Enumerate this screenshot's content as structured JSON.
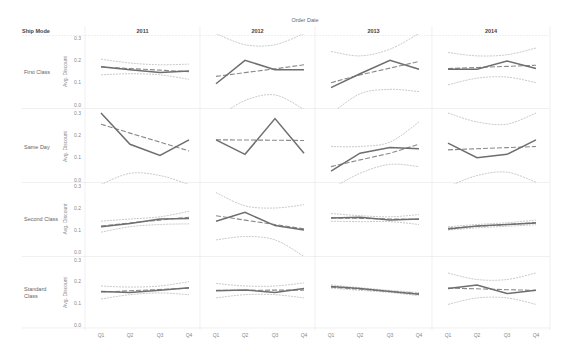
{
  "chart_data": {
    "type": "line",
    "title": "",
    "column_field": "Order Date",
    "row_field": "Ship Mode",
    "ylabel": "Avg. Discount",
    "ylim": [
      0,
      0.3
    ],
    "yticks": [
      "0.0",
      "0.1",
      "0.2",
      "0.3"
    ],
    "categories": [
      "Q1",
      "Q2",
      "Q3",
      "Q4"
    ],
    "columns": [
      "2011",
      "2012",
      "2013",
      "2014"
    ],
    "rows": [
      "First Class",
      "Same Day",
      "Second Class",
      "Standard Class"
    ],
    "grid": false,
    "panels": [
      {
        "row": "First Class",
        "year": "2011",
        "values": [
          0.171,
          0.158,
          0.145,
          0.152
        ],
        "trend": [
          0.17,
          0.163,
          0.156,
          0.149
        ],
        "band_upper": [
          0.205,
          0.188,
          0.18,
          0.183
        ],
        "band_lower": [
          0.135,
          0.14,
          0.135,
          0.115
        ]
      },
      {
        "row": "First Class",
        "year": "2012",
        "values": [
          0.095,
          0.2,
          0.158,
          0.158
        ],
        "trend": [
          0.128,
          0.145,
          0.162,
          0.18
        ],
        "band_upper": [
          0.32,
          0.27,
          0.27,
          0.32
        ],
        "band_lower": [
          -0.06,
          0.02,
          0.045,
          -0.02
        ]
      },
      {
        "row": "First Class",
        "year": "2013",
        "values": [
          0.078,
          0.14,
          0.2,
          0.16
        ],
        "trend": [
          0.1,
          0.135,
          0.165,
          0.195
        ],
        "band_upper": [
          0.24,
          0.22,
          0.25,
          0.32
        ],
        "band_lower": [
          -0.04,
          0.05,
          0.07,
          0.06
        ]
      },
      {
        "row": "First Class",
        "year": "2014",
        "values": [
          0.16,
          0.16,
          0.197,
          0.163
        ],
        "trend": [
          0.163,
          0.168,
          0.173,
          0.178
        ],
        "band_upper": [
          0.235,
          0.22,
          0.225,
          0.255
        ],
        "band_lower": [
          0.09,
          0.12,
          0.125,
          0.1
        ]
      }
    ],
    "panels_same_day": [
      {
        "row": "Same Day",
        "year": "2011",
        "values": [
          0.3,
          0.16,
          0.11,
          0.18
        ],
        "trend": [
          0.25,
          0.21,
          0.17,
          0.13
        ],
        "band_upper": [
          0.38,
          0.37,
          0.36,
          0.35
        ],
        "band_lower": [
          -0.02,
          0.03,
          0.02,
          -0.02
        ]
      },
      {
        "row": "Same Day",
        "year": "2012",
        "values": [
          0.18,
          0.115,
          0.275,
          0.12
        ],
        "trend": [
          0.18,
          0.179,
          0.178,
          0.177
        ],
        "band_upper": [
          0.42,
          0.4,
          0.4,
          0.42
        ],
        "band_lower": [
          -0.06,
          -0.05,
          -0.05,
          -0.06
        ]
      },
      {
        "row": "Same Day",
        "year": "2013",
        "values": [
          0.04,
          0.12,
          0.145,
          0.14
        ],
        "trend": [
          0.06,
          0.09,
          0.12,
          0.16
        ],
        "band_upper": [
          0.15,
          0.15,
          0.17,
          0.26
        ],
        "band_lower": [
          -0.04,
          0.03,
          0.07,
          0.06
        ]
      },
      {
        "row": "Same Day",
        "year": "2014",
        "values": [
          0.165,
          0.1,
          0.115,
          0.18
        ],
        "trend": [
          0.135,
          0.14,
          0.145,
          0.15
        ],
        "band_upper": [
          0.3,
          0.26,
          0.25,
          0.3
        ],
        "band_lower": [
          -0.03,
          0.02,
          0.035,
          -0.01
        ]
      }
    ],
    "panels_second_class": [
      {
        "row": "Second Class",
        "year": "2011",
        "values": [
          0.115,
          0.13,
          0.15,
          0.152
        ],
        "trend": [
          0.118,
          0.132,
          0.145,
          0.158
        ],
        "band_upper": [
          0.14,
          0.15,
          0.16,
          0.185
        ],
        "band_lower": [
          0.09,
          0.115,
          0.125,
          0.128
        ]
      },
      {
        "row": "Second Class",
        "year": "2012",
        "values": [
          0.14,
          0.18,
          0.12,
          0.1
        ],
        "trend": [
          0.165,
          0.145,
          0.125,
          0.105
        ],
        "band_upper": [
          0.27,
          0.21,
          0.2,
          0.215
        ],
        "band_lower": [
          0.055,
          0.07,
          0.055,
          -0.02
        ]
      },
      {
        "row": "Second Class",
        "year": "2013",
        "values": [
          0.155,
          0.158,
          0.145,
          0.15
        ],
        "trend": [
          0.155,
          0.153,
          0.15,
          0.148
        ],
        "band_upper": [
          0.175,
          0.165,
          0.16,
          0.17
        ],
        "band_lower": [
          0.14,
          0.138,
          0.138,
          0.125
        ]
      },
      {
        "row": "Second Class",
        "year": "2014",
        "values": [
          0.105,
          0.118,
          0.125,
          0.132
        ],
        "trend": [
          0.108,
          0.117,
          0.125,
          0.134
        ],
        "band_upper": [
          0.115,
          0.125,
          0.133,
          0.145
        ],
        "band_lower": [
          0.1,
          0.11,
          0.117,
          0.124
        ]
      }
    ],
    "panels_standard": [
      {
        "row": "Standard Class",
        "year": "2011",
        "values": [
          0.155,
          0.15,
          0.16,
          0.172
        ],
        "trend": [
          0.152,
          0.158,
          0.164,
          0.17
        ],
        "band_upper": [
          0.18,
          0.175,
          0.18,
          0.2
        ],
        "band_lower": [
          0.12,
          0.14,
          0.148,
          0.14
        ]
      },
      {
        "row": "Standard Class",
        "year": "2012",
        "values": [
          0.158,
          0.162,
          0.15,
          0.168
        ],
        "trend": [
          0.16,
          0.16,
          0.161,
          0.161
        ],
        "band_upper": [
          0.192,
          0.18,
          0.18,
          0.194
        ],
        "band_lower": [
          0.125,
          0.14,
          0.14,
          0.125
        ]
      },
      {
        "row": "Standard Class",
        "year": "2013",
        "values": [
          0.178,
          0.168,
          0.155,
          0.142
        ],
        "trend": [
          0.175,
          0.165,
          0.155,
          0.145
        ],
        "band_upper": [
          0.185,
          0.172,
          0.16,
          0.15
        ],
        "band_lower": [
          0.17,
          0.16,
          0.15,
          0.135
        ]
      },
      {
        "row": "Standard Class",
        "year": "2014",
        "values": [
          0.168,
          0.185,
          0.145,
          0.16
        ],
        "trend": [
          0.17,
          0.167,
          0.163,
          0.16
        ],
        "band_upper": [
          0.24,
          0.21,
          0.21,
          0.24
        ],
        "band_lower": [
          0.095,
          0.125,
          0.125,
          0.095
        ]
      }
    ],
    "legend": null
  },
  "labels": {
    "column_field": "Order Date",
    "row_field": "Ship Mode",
    "y_axis_title": "Avg. Discount",
    "row_labels": [
      [
        "First Class"
      ],
      [
        "Same Day"
      ],
      [
        "Second Class"
      ],
      [
        "Standard",
        "Class"
      ]
    ]
  },
  "colors": {
    "line": "#6e6e6e",
    "trend": "#8a8a8a",
    "band": "#bdbdbd",
    "divider": "#e6e6e6",
    "text": "#666666"
  }
}
